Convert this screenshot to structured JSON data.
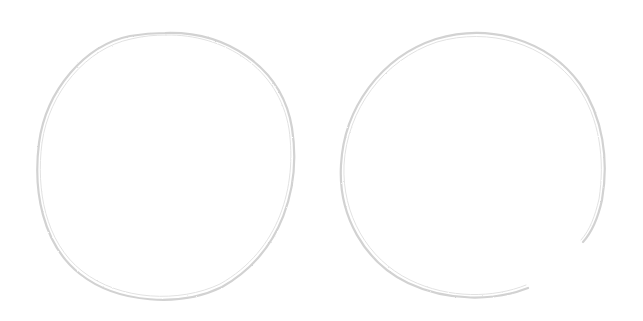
{
  "scene": {
    "description": "Two hand-drawn pencil circles on white paper",
    "background_color": "#ffffff",
    "stroke_color": "#cfcfcf",
    "shapes": [
      {
        "name": "closed-circle",
        "closed": true,
        "center": [
          167,
          167
        ],
        "rx": 130,
        "ry": 135
      },
      {
        "name": "open-circle",
        "closed": false,
        "center": [
          473,
          166
        ],
        "rx": 133,
        "ry": 133,
        "gap_from": [
          528,
          288
        ],
        "gap_to": [
          583,
          242
        ]
      }
    ]
  }
}
